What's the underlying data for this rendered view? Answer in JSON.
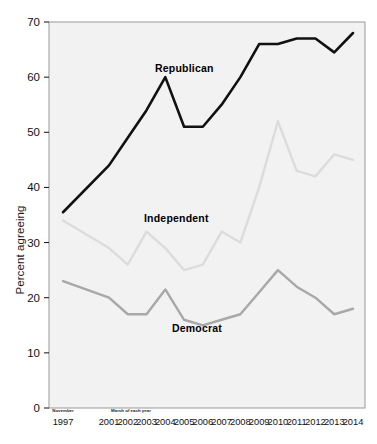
{
  "chart_data": {
    "type": "line",
    "title": "",
    "subtitle": "",
    "xlabel": "",
    "ylabel": "Percent agreeing",
    "ylim": [
      0,
      70
    ],
    "ytick_values": [
      0,
      10,
      20,
      30,
      40,
      50,
      60,
      70
    ],
    "ytick_labels": [
      "0",
      "10",
      "20",
      "30",
      "40",
      "50",
      "60",
      "70"
    ],
    "grid": false,
    "legend_position": "inline-annotations",
    "x_notes": {
      "first_point_note": "November",
      "rest_note": "March of each year"
    },
    "categories": [
      "1997",
      "2001",
      "2002",
      "2003",
      "2004",
      "2005",
      "2006",
      "2007",
      "2008",
      "2009",
      "2010",
      "2011",
      "2012",
      "2013",
      "2014"
    ],
    "series": [
      {
        "name": "Republican",
        "color": "#111111",
        "values": [
          35.5,
          44,
          49,
          54,
          60,
          51,
          51,
          55,
          60,
          66,
          66,
          67,
          67,
          64.5,
          68
        ]
      },
      {
        "name": "Independent",
        "color": "#dcdcdc",
        "values": [
          34,
          29,
          26,
          32,
          29,
          25,
          26,
          32,
          30,
          40,
          52,
          43,
          42,
          46,
          45
        ]
      },
      {
        "name": "Democrat",
        "color": "#a8a8a8",
        "values": [
          23,
          20,
          17,
          17,
          21.5,
          16,
          15,
          16,
          17,
          21,
          25,
          22,
          20,
          17,
          18
        ]
      }
    ],
    "annotations": [
      {
        "text": "Republican",
        "series": "Republican"
      },
      {
        "text": "Independent",
        "series": "Independent"
      },
      {
        "text": "Democrat",
        "series": "Democrat"
      }
    ]
  }
}
